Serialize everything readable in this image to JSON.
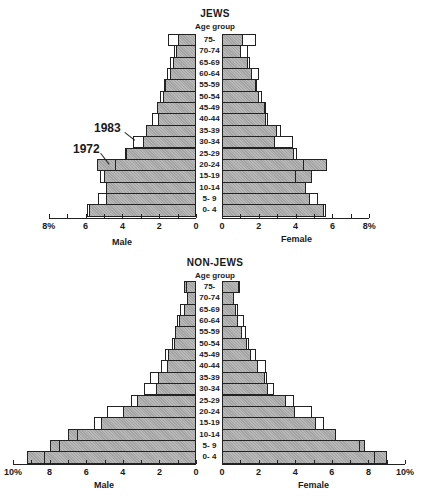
{
  "chart_data": [
    {
      "type": "bar",
      "subtype": "population-pyramid",
      "title": "JEWS",
      "category_axis_label": "Age group",
      "categories": [
        "75-",
        "70-74",
        "65-69",
        "60-64",
        "55-59",
        "50-54",
        "45-49",
        "40-44",
        "35-39",
        "30-34",
        "25-29",
        "20-24",
        "15-19",
        "10-14",
        "5- 9",
        "0- 4"
      ],
      "series": [
        {
          "name": "1972 Male",
          "side": "male",
          "year": "1972",
          "style": "shaded",
          "values": [
            1.0,
            1.1,
            1.25,
            1.4,
            1.7,
            1.8,
            2.1,
            2.05,
            2.7,
            2.9,
            3.8,
            5.4,
            5.0,
            4.9,
            4.9,
            5.8
          ]
        },
        {
          "name": "1983 Male",
          "side": "male",
          "year": "1983",
          "style": "outline",
          "values": [
            1.5,
            1.2,
            1.4,
            1.6,
            1.75,
            1.95,
            2.1,
            2.4,
            2.7,
            3.4,
            3.85,
            4.4,
            5.2,
            4.9,
            5.35,
            5.9
          ]
        },
        {
          "name": "1972 Female",
          "side": "female",
          "year": "1972",
          "style": "shaded",
          "values": [
            1.15,
            1.05,
            1.4,
            1.65,
            1.85,
            2.0,
            2.35,
            2.4,
            3.0,
            2.9,
            3.9,
            5.7,
            4.9,
            4.55,
            4.8,
            5.55
          ]
        },
        {
          "name": "1983 Female",
          "side": "female",
          "year": "1983",
          "style": "outline",
          "values": [
            1.85,
            1.4,
            1.5,
            2.0,
            1.9,
            2.15,
            2.4,
            2.5,
            3.2,
            3.85,
            4.05,
            4.45,
            4.0,
            4.55,
            5.2,
            5.65
          ]
        }
      ],
      "xlabel_male": "Male",
      "xlabel_female": "Female",
      "male_ticks": [
        "8%",
        "6",
        "4",
        "2",
        "0"
      ],
      "female_ticks": [
        "0",
        "2",
        "4",
        "6",
        "8%"
      ],
      "xlim": [
        0,
        8
      ],
      "annotations": [
        "1983",
        "1972"
      ],
      "grid": false
    },
    {
      "type": "bar",
      "subtype": "population-pyramid",
      "title": "NON-JEWS",
      "category_axis_label": "Age group",
      "categories": [
        "75-",
        "70-74",
        "65-69",
        "60-64",
        "55-59",
        "50-54",
        "45-49",
        "40-44",
        "35-39",
        "30-34",
        "25-29",
        "20-24",
        "15-19",
        "10-14",
        "5- 9",
        "0- 4"
      ],
      "series": [
        {
          "name": "1972 Male",
          "side": "male",
          "year": "1972",
          "style": "shaded",
          "values": [
            0.65,
            0.5,
            0.65,
            0.95,
            1.15,
            1.2,
            1.55,
            1.6,
            2.1,
            2.2,
            3.2,
            4.0,
            5.2,
            7.0,
            8.0,
            9.25
          ]
        },
        {
          "name": "1983 Male",
          "side": "male",
          "year": "1983",
          "style": "outline",
          "values": [
            0.55,
            0.5,
            0.9,
            1.05,
            1.15,
            1.3,
            1.7,
            1.9,
            2.5,
            2.85,
            3.55,
            4.85,
            5.6,
            6.5,
            7.5,
            8.3
          ]
        },
        {
          "name": "1972 Female",
          "side": "female",
          "year": "1972",
          "style": "shaded",
          "values": [
            1.0,
            0.65,
            0.75,
            0.85,
            1.1,
            1.35,
            1.6,
            1.95,
            2.35,
            2.5,
            3.5,
            4.0,
            5.15,
            6.25,
            7.8,
            9.0
          ]
        },
        {
          "name": "1983 Female",
          "side": "female",
          "year": "1983",
          "style": "outline",
          "values": [
            0.95,
            0.65,
            0.9,
            1.2,
            1.3,
            1.5,
            1.85,
            2.4,
            2.45,
            2.85,
            3.95,
            4.9,
            5.55,
            6.25,
            7.55,
            8.35
          ]
        }
      ],
      "xlabel_male": "Male",
      "xlabel_female": "Female",
      "male_ticks": [
        "10%",
        "8",
        "6",
        "4",
        "2",
        "0"
      ],
      "female_ticks": [
        "0",
        "2",
        "4",
        "6",
        "8",
        "10%"
      ],
      "xlim": [
        0,
        10
      ],
      "grid": false
    }
  ],
  "top": {
    "title": "JEWS",
    "subtitle": "Age group",
    "male_label": "Male",
    "female_label": "Female",
    "annotation_1983": "1983",
    "annotation_1972": "1972"
  },
  "bottom": {
    "title": "NON-JEWS",
    "subtitle": "Age group",
    "male_label": "Male",
    "female_label": "Female"
  },
  "colors": {
    "shaded": "#a8a8a8",
    "outline": "#222222",
    "background": "#ffffff"
  }
}
